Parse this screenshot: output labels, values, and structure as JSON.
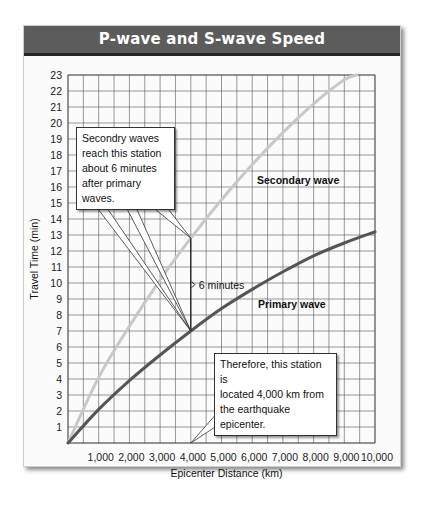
{
  "title": "P-wave and S-wave Speed",
  "chart_data": {
    "type": "line",
    "title": "P-wave and S-wave Speed",
    "xlabel": "Epicenter Distance (km)",
    "ylabel": "Travel Time (min)",
    "xlim": [
      0,
      10000
    ],
    "ylim": [
      0,
      23
    ],
    "grid": true,
    "x_ticks": [
      "1,000",
      "2,000",
      "3,000",
      "4,000",
      "5,000",
      "6,000",
      "7,000",
      "8,000",
      "9,000",
      "10,000"
    ],
    "y_ticks": [
      "1",
      "2",
      "3",
      "4",
      "5",
      "6",
      "7",
      "8",
      "9",
      "10",
      "11",
      "12",
      "13",
      "14",
      "15",
      "16",
      "17",
      "18",
      "19",
      "20",
      "21",
      "22",
      "23"
    ],
    "series": [
      {
        "name": "Secondary wave",
        "color": "#c8c8c8",
        "x": [
          0,
          1000,
          2000,
          3000,
          4000,
          5000,
          6000,
          7000,
          8000,
          9000,
          9400
        ],
        "y": [
          0,
          4.1,
          7.3,
          10.2,
          12.8,
          15.2,
          17.4,
          19.4,
          21.2,
          22.7,
          23
        ]
      },
      {
        "name": "Primary wave",
        "color": "#555555",
        "x": [
          0,
          1000,
          2000,
          3000,
          4000,
          5000,
          6000,
          7000,
          8000,
          9000,
          10000
        ],
        "y": [
          0,
          2.1,
          3.9,
          5.5,
          7.0,
          8.4,
          9.6,
          10.7,
          11.7,
          12.5,
          13.2
        ]
      }
    ],
    "annotations": [
      {
        "text": "Secondry waves reach this station about 6 minutes after primary waves.",
        "points_to": [
          [
            4000,
            12.8
          ],
          [
            4000,
            7.0
          ]
        ]
      },
      {
        "text": "6 minutes",
        "bracket": [
          4000,
          7.0,
          12.8
        ]
      },
      {
        "text": "Therefore, this station is located 4,000  km from the earthquake epicenter.",
        "points_to": [
          [
            4000,
            0
          ]
        ]
      }
    ]
  },
  "labels": {
    "secondary": "Secondary wave",
    "primary": "Primary wave",
    "six_minutes": "6 minutes",
    "xlabel": "Epicenter Distance (km)",
    "ylabel": "Travel Time (min)"
  },
  "callouts": {
    "top": [
      "Secondry waves",
      "reach this station",
      "about 6 minutes",
      "after primary waves."
    ],
    "bottom": [
      "Therefore, this station is",
      "located 4,000  km from",
      "the earthquake epicenter."
    ]
  }
}
